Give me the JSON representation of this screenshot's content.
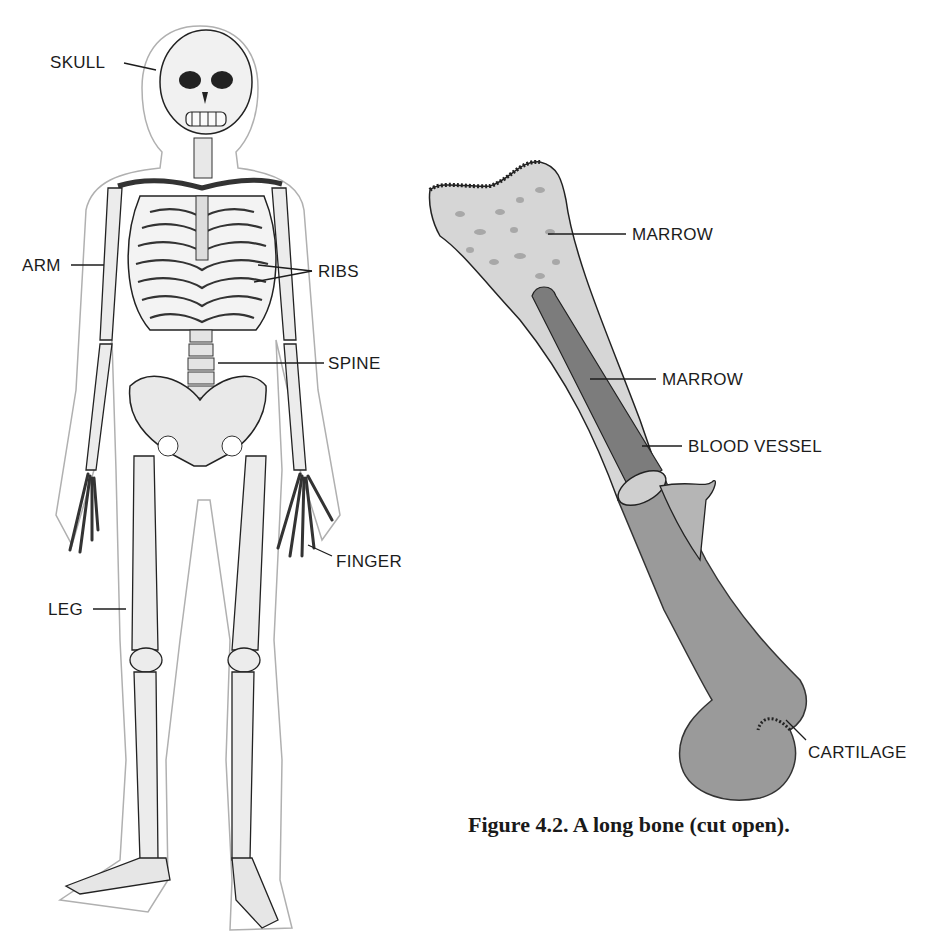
{
  "figure": {
    "caption": "Figure 4.2. A long bone (cut open).",
    "skeleton": {
      "labels": {
        "skull": "SKULL",
        "arm": "ARM",
        "ribs": "RIBS",
        "spine": "SPINE",
        "finger": "FINGER",
        "leg": "LEG"
      }
    },
    "long_bone": {
      "labels": {
        "marrow_top": "MARROW",
        "marrow_mid": "MARROW",
        "blood_vessel": "BLOOD VESSEL",
        "cartilage": "CARTILAGE"
      }
    },
    "colors": {
      "background": "#ffffff",
      "bone_spongy": "#d6d6d6",
      "bone_shaft": "#9a9a9a",
      "marrow_core": "#7c7c7c",
      "ink": "#1c1c1c",
      "outline": "#a0a0a0"
    }
  }
}
